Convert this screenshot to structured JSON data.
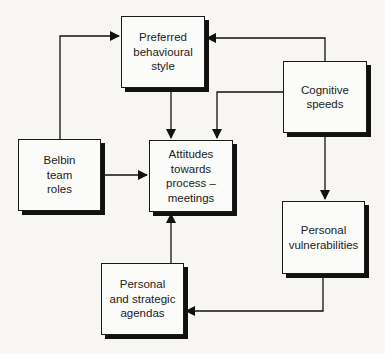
{
  "diagram": {
    "nodes": [
      {
        "id": "preferred",
        "lines": [
          "Preferred",
          "behavioural",
          "style"
        ]
      },
      {
        "id": "cognitive",
        "lines": [
          "Cognitive",
          "speeds"
        ]
      },
      {
        "id": "belbin",
        "lines": [
          "Belbin",
          "team",
          "roles"
        ]
      },
      {
        "id": "attitudes",
        "lines": [
          "Attitudes",
          "towards",
          "process –",
          "meetings"
        ]
      },
      {
        "id": "vulnerabilities",
        "lines": [
          "Personal",
          "vulnerabilities"
        ]
      },
      {
        "id": "agendas",
        "lines": [
          "Personal",
          "and strategic",
          "agendas"
        ]
      }
    ],
    "edges": [
      {
        "from": "belbin",
        "to": "preferred"
      },
      {
        "from": "cognitive",
        "to": "preferred"
      },
      {
        "from": "preferred",
        "to": "attitudes"
      },
      {
        "from": "cognitive",
        "to": "attitudes"
      },
      {
        "from": "belbin",
        "to": "attitudes"
      },
      {
        "from": "cognitive",
        "to": "vulnerabilities"
      },
      {
        "from": "vulnerabilities",
        "to": "agendas"
      },
      {
        "from": "agendas",
        "to": "attitudes"
      }
    ],
    "colors": {
      "line": "#111111",
      "box_fill": "#fbfbf9",
      "background": "#f7f6f3"
    }
  }
}
